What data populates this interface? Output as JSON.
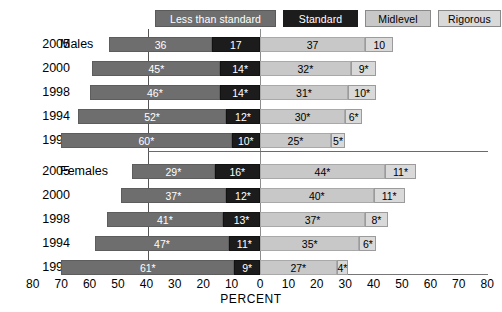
{
  "chart_data": {
    "type": "bar",
    "subtype": "diverging-stacked-bar",
    "title": "",
    "xlabel": "PERCENT",
    "ylabel": "",
    "xlim": [
      -80,
      80
    ],
    "xticks": [
      80,
      70,
      60,
      50,
      40,
      30,
      20,
      10,
      0,
      10,
      20,
      30,
      40,
      50,
      60,
      70,
      80
    ],
    "grid": false,
    "legend_position": "top",
    "note": "Segments 'Less than standard' and 'Standard' extend left of zero; 'Midlevel' and 'Rigorous' extend right of zero.",
    "legend": [
      {
        "key": "less",
        "label": "Less than standard",
        "color": "#6e6e6e",
        "side": "left"
      },
      {
        "key": "standard",
        "label": "Standard",
        "color": "#1c1c1c",
        "side": "left"
      },
      {
        "key": "midlevel",
        "label": "Midlevel",
        "color": "#c8c8c8",
        "side": "right"
      },
      {
        "key": "rigorous",
        "label": "Rigorous",
        "color": "#d9d9d9",
        "side": "right"
      }
    ],
    "series": [
      {
        "name": "Less than standard",
        "values": [
          36,
          45,
          46,
          52,
          60,
          29,
          37,
          41,
          47,
          61
        ]
      },
      {
        "name": "Standard",
        "values": [
          17,
          14,
          14,
          12,
          10,
          16,
          12,
          13,
          11,
          9
        ]
      },
      {
        "name": "Midlevel",
        "values": [
          37,
          32,
          31,
          30,
          25,
          44,
          40,
          37,
          35,
          27
        ]
      },
      {
        "name": "Rigorous",
        "values": [
          10,
          9,
          10,
          6,
          5,
          11,
          11,
          8,
          6,
          4
        ]
      }
    ],
    "panels": [
      {
        "group": "Males",
        "rows": [
          {
            "year": "2005",
            "less": 36,
            "standard": 17,
            "midlevel": 37,
            "rigorous": 10,
            "labels": {
              "less": "36",
              "standard": "17",
              "midlevel": "37",
              "rigorous": "10"
            }
          },
          {
            "year": "2000",
            "less": 45,
            "standard": 14,
            "midlevel": 32,
            "rigorous": 9,
            "labels": {
              "less": "45*",
              "standard": "14*",
              "midlevel": "32*",
              "rigorous": "9*"
            }
          },
          {
            "year": "1998",
            "less": 46,
            "standard": 14,
            "midlevel": 31,
            "rigorous": 10,
            "labels": {
              "less": "46*",
              "standard": "14*",
              "midlevel": "31*",
              "rigorous": "10*"
            }
          },
          {
            "year": "1994",
            "less": 52,
            "standard": 12,
            "midlevel": 30,
            "rigorous": 6,
            "labels": {
              "less": "52*",
              "standard": "12*",
              "midlevel": "30*",
              "rigorous": "6*"
            }
          },
          {
            "year": "1990",
            "less": 60,
            "standard": 10,
            "midlevel": 25,
            "rigorous": 5,
            "labels": {
              "less": "60*",
              "standard": "10*",
              "midlevel": "25*",
              "rigorous": "5*"
            }
          }
        ]
      },
      {
        "group": "Females",
        "rows": [
          {
            "year": "2005",
            "less": 29,
            "standard": 16,
            "midlevel": 44,
            "rigorous": 11,
            "labels": {
              "less": "29*",
              "standard": "16*",
              "midlevel": "44*",
              "rigorous": "11*"
            }
          },
          {
            "year": "2000",
            "less": 37,
            "standard": 12,
            "midlevel": 40,
            "rigorous": 11,
            "labels": {
              "less": "37*",
              "standard": "12*",
              "midlevel": "40*",
              "rigorous": "11*"
            }
          },
          {
            "year": "1998",
            "less": 41,
            "standard": 13,
            "midlevel": 37,
            "rigorous": 8,
            "labels": {
              "less": "41*",
              "standard": "13*",
              "midlevel": "37*",
              "rigorous": "8*"
            }
          },
          {
            "year": "1994",
            "less": 47,
            "standard": 11,
            "midlevel": 35,
            "rigorous": 6,
            "labels": {
              "less": "47*",
              "standard": "11*",
              "midlevel": "35*",
              "rigorous": "6*"
            }
          },
          {
            "year": "1990",
            "less": 61,
            "standard": 9,
            "midlevel": 27,
            "rigorous": 4,
            "labels": {
              "less": "61*",
              "standard": "9*",
              "midlevel": "27*",
              "rigorous": "4*"
            }
          }
        ]
      }
    ]
  },
  "layout": {
    "zero_x": 260,
    "px_per_percent": 2.84,
    "row_tops": [
      33,
      57,
      81,
      105,
      129,
      160,
      184,
      208,
      232,
      256
    ]
  }
}
